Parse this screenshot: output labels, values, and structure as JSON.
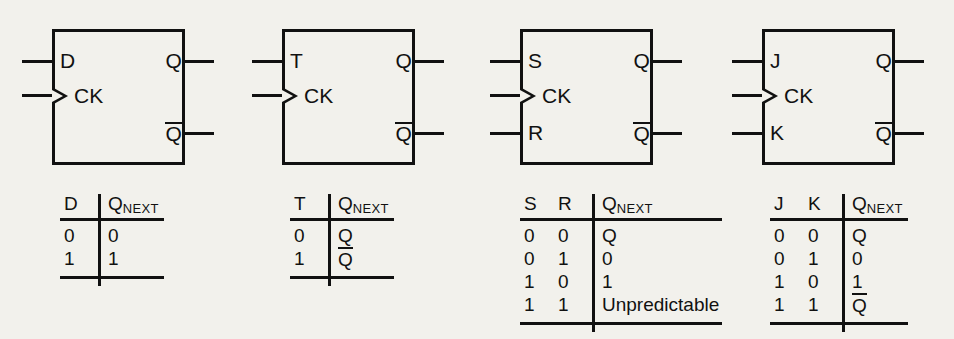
{
  "figure": {
    "background_color": "#f2f1ec",
    "ink_color": "#111111"
  },
  "blocks": [
    {
      "id": "d-flip-flop",
      "name": "D flip-flop",
      "pins": {
        "input_top": "D",
        "clock": "CK",
        "input_bottom": null,
        "output_top": "Q",
        "output_bottom": "Q",
        "output_bottom_overline": true
      },
      "table": {
        "headers": [
          "D",
          "Q"
        ],
        "header_subscripts": [
          null,
          "NEXT"
        ],
        "rows": [
          [
            {
              "text": "0",
              "overline": false
            },
            {
              "text": "0",
              "overline": false
            }
          ],
          [
            {
              "text": "1",
              "overline": false
            },
            {
              "text": "1",
              "overline": false
            }
          ]
        ]
      }
    },
    {
      "id": "t-flip-flop",
      "name": "T flip-flop",
      "pins": {
        "input_top": "T",
        "clock": "CK",
        "input_bottom": null,
        "output_top": "Q",
        "output_bottom": "Q",
        "output_bottom_overline": true
      },
      "table": {
        "headers": [
          "T",
          "Q"
        ],
        "header_subscripts": [
          null,
          "NEXT"
        ],
        "rows": [
          [
            {
              "text": "0",
              "overline": false
            },
            {
              "text": "Q",
              "overline": false
            }
          ],
          [
            {
              "text": "1",
              "overline": false
            },
            {
              "text": "Q",
              "overline": true
            }
          ]
        ]
      }
    },
    {
      "id": "sr-flip-flop",
      "name": "SR flip-flop",
      "pins": {
        "input_top": "S",
        "clock": "CK",
        "input_bottom": "R",
        "output_top": "Q",
        "output_bottom": "Q",
        "output_bottom_overline": true
      },
      "table": {
        "headers": [
          "S",
          "R",
          "Q"
        ],
        "header_subscripts": [
          null,
          null,
          "NEXT"
        ],
        "rows": [
          [
            {
              "text": "0",
              "overline": false
            },
            {
              "text": "0",
              "overline": false
            },
            {
              "text": "Q",
              "overline": false
            }
          ],
          [
            {
              "text": "0",
              "overline": false
            },
            {
              "text": "1",
              "overline": false
            },
            {
              "text": "0",
              "overline": false
            }
          ],
          [
            {
              "text": "1",
              "overline": false
            },
            {
              "text": "0",
              "overline": false
            },
            {
              "text": "1",
              "overline": false
            }
          ],
          [
            {
              "text": "1",
              "overline": false
            },
            {
              "text": "1",
              "overline": false
            },
            {
              "text": "Unpredictable",
              "overline": false
            }
          ]
        ]
      }
    },
    {
      "id": "jk-flip-flop",
      "name": "JK flip-flop",
      "pins": {
        "input_top": "J",
        "clock": "CK",
        "input_bottom": "K",
        "output_top": "Q",
        "output_bottom": "Q",
        "output_bottom_overline": true
      },
      "table": {
        "headers": [
          "J",
          "K",
          "Q"
        ],
        "header_subscripts": [
          null,
          null,
          "NEXT"
        ],
        "rows": [
          [
            {
              "text": "0",
              "overline": false
            },
            {
              "text": "0",
              "overline": false
            },
            {
              "text": "Q",
              "overline": false
            }
          ],
          [
            {
              "text": "0",
              "overline": false
            },
            {
              "text": "1",
              "overline": false
            },
            {
              "text": "0",
              "overline": false
            }
          ],
          [
            {
              "text": "1",
              "overline": false
            },
            {
              "text": "0",
              "overline": false
            },
            {
              "text": "1",
              "overline": false
            }
          ],
          [
            {
              "text": "1",
              "overline": false
            },
            {
              "text": "1",
              "overline": false
            },
            {
              "text": "Q",
              "overline": true
            }
          ]
        ]
      }
    }
  ],
  "layout": {
    "block_x": [
      0,
      230,
      468,
      710
    ],
    "table_x": [
      60,
      290,
      520,
      770
    ],
    "table_y": 192
  }
}
